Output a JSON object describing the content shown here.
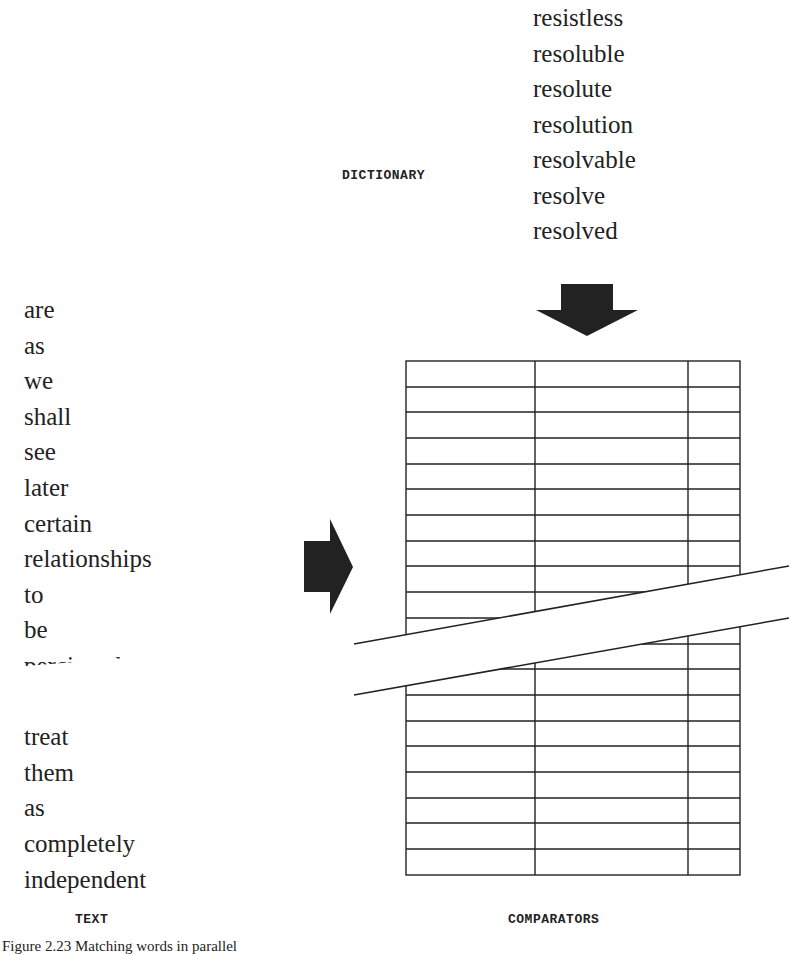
{
  "figure": {
    "caption": "Figure 2.23   Matching words in parallel",
    "labels": {
      "dictionary": "DICTIONARY",
      "text": "TEXT",
      "comparators": "COMPARATORS"
    },
    "dictionary_words": [
      "resistless",
      "resoluble",
      "resolute",
      "resolution",
      "resolvable",
      "resolve",
      "resolved"
    ],
    "text_words": [
      "are",
      "as",
      "we",
      "shall",
      "see",
      "later",
      "certain",
      "relationships",
      "to",
      "be",
      "percieved",
      "",
      "treat",
      "them",
      "as",
      "completely",
      "independent"
    ],
    "comparator_table": {
      "columns": 3,
      "visible_rows_above_break": 11,
      "visible_rows_below_break": 7
    },
    "arrows": {
      "dictionary_to_comparators": "down-arrow",
      "text_to_comparators": "right-arrow"
    },
    "colors": {
      "ink": "#222222",
      "background": "#ffffff"
    }
  }
}
